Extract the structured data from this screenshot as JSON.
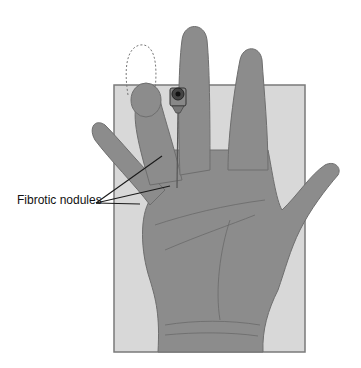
{
  "figure": {
    "annotations": [
      {
        "text": "Fibrotic nodules",
        "pointer_count": 3
      }
    ],
    "elements": [
      "hand-palm-view",
      "background-panel",
      "needle-syringe-tip",
      "flexed-ring-finger-outline"
    ],
    "colors": {
      "panel": "#d8d8d8",
      "panel_border": "#7a7a7a",
      "skin": "#8c8c8c",
      "skin_line": "#6e6e6e",
      "needle": "#555555",
      "leader_line": "#1a1a1a"
    }
  }
}
